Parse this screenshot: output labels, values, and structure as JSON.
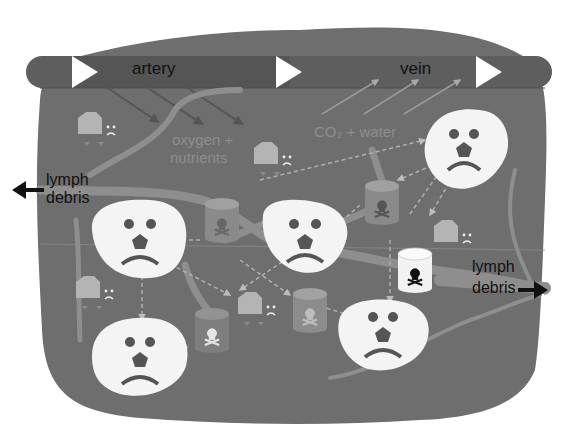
{
  "diagram": {
    "colors": {
      "background": "#ffffff",
      "tissue": "#6e6e6e",
      "vessel_band": "#5e5e5e",
      "cell": "#f4f4f4",
      "toxin_can": "#8a8a8a",
      "toxin_can_light": "#f0f0f0",
      "lymph_path": "#9a9a9a",
      "label_text": "#111111",
      "faint_text": "#8a8a8a"
    },
    "labels": {
      "artery": "artery",
      "vein": "vein",
      "oxygen_nutrients_line1": "oxygen +",
      "oxygen_nutrients_line2": "nutrients",
      "co2_water": "CO₂ + water",
      "lymph_left_line1": "lymph",
      "lymph_left_line2": "debris",
      "lymph_right_line1": "lymph",
      "lymph_right_line2": "debris"
    },
    "icons": {
      "flow_arrow": "white-triangle-arrow",
      "exit_arrow": "black-arrow",
      "cell_face": "sad-face",
      "toxin": "skull-crossbones-canister",
      "factory": "factory-building-sad"
    },
    "cells": [
      {
        "id": "cell-1",
        "x": 140,
        "y": 240
      },
      {
        "id": "cell-2",
        "x": 305,
        "y": 236
      },
      {
        "id": "cell-3",
        "x": 464,
        "y": 150
      },
      {
        "id": "cell-4",
        "x": 140,
        "y": 356
      },
      {
        "id": "cell-5",
        "x": 383,
        "y": 331
      }
    ],
    "toxins": [
      {
        "id": "toxin-1",
        "x": 222,
        "y": 218,
        "light": false
      },
      {
        "id": "toxin-2",
        "x": 382,
        "y": 200,
        "light": false
      },
      {
        "id": "toxin-3",
        "x": 415,
        "y": 270,
        "light": true
      },
      {
        "id": "toxin-4",
        "x": 212,
        "y": 328,
        "light": false
      },
      {
        "id": "toxin-5",
        "x": 310,
        "y": 308,
        "light": false
      }
    ],
    "factories": [
      {
        "id": "factory-1",
        "x": 90,
        "y": 122
      },
      {
        "id": "factory-2",
        "x": 266,
        "y": 152
      },
      {
        "id": "factory-3",
        "x": 88,
        "y": 286
      },
      {
        "id": "factory-4",
        "x": 250,
        "y": 302
      },
      {
        "id": "factory-5",
        "x": 446,
        "y": 230
      }
    ]
  }
}
